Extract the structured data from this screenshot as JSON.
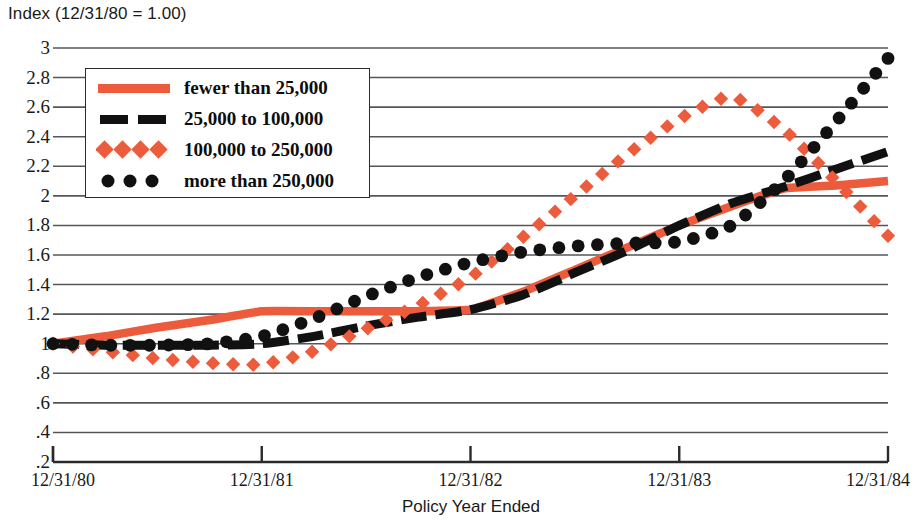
{
  "chart_data": {
    "type": "line",
    "title": "Index (12/31/80 = 1.00)",
    "xlabel": "Policy Year Ended",
    "ylabel": "Index (12/31/80 = 1.00)",
    "xlim": [
      1980.0,
      1984.0
    ],
    "ylim": [
      0.2,
      3.0
    ],
    "grid": true,
    "legend_position": "upper-left",
    "x_categories": [
      "12/31/80",
      "12/31/81",
      "12/31/82",
      "12/31/83",
      "12/31/84"
    ],
    "y_ticks": [
      "3",
      "2.8",
      "2.6",
      "2.4",
      "2.2",
      "2",
      "1.8",
      "1.6",
      "1.4",
      "1.2",
      "1",
      ".8",
      ".6",
      ".4",
      ".2"
    ],
    "y_tick_values": [
      3,
      2.8,
      2.6,
      2.4,
      2.2,
      2,
      1.8,
      1.6,
      1.4,
      1.2,
      1,
      0.8,
      0.6,
      0.4,
      0.2
    ],
    "series": [
      {
        "name": "fewer than 25,000",
        "style": "solid-line",
        "color": "#EC5B3B",
        "x": [
          1980.0,
          1980.25,
          1980.5,
          1980.75,
          1981.0,
          1981.25,
          1981.5,
          1981.75,
          1982.0,
          1982.25,
          1982.5,
          1982.75,
          1983.0,
          1983.25,
          1983.5,
          1983.75,
          1984.0
        ],
        "values": [
          1.0,
          1.05,
          1.11,
          1.16,
          1.22,
          1.22,
          1.22,
          1.22,
          1.23,
          1.35,
          1.5,
          1.65,
          1.8,
          1.93,
          2.05,
          2.07,
          2.1
        ]
      },
      {
        "name": "25,000 to 100,000",
        "style": "dashed-line",
        "color": "#111111",
        "x": [
          1980.0,
          1980.25,
          1980.5,
          1980.75,
          1981.0,
          1981.25,
          1981.5,
          1981.75,
          1982.0,
          1982.25,
          1982.5,
          1982.75,
          1983.0,
          1983.25,
          1983.5,
          1983.75,
          1984.0
        ],
        "values": [
          1.0,
          0.99,
          0.99,
          0.99,
          1.0,
          1.05,
          1.12,
          1.18,
          1.23,
          1.33,
          1.48,
          1.63,
          1.8,
          1.95,
          2.06,
          2.18,
          2.3
        ]
      },
      {
        "name": "100,000 to 250,000",
        "style": "diamond-markers",
        "color": "#EC5B3B",
        "x": [
          1980.0,
          1980.25,
          1980.5,
          1980.75,
          1981.0,
          1981.25,
          1981.5,
          1981.75,
          1982.0,
          1982.25,
          1982.5,
          1982.75,
          1983.0,
          1983.25,
          1983.5,
          1983.75,
          1984.0
        ],
        "values": [
          1.0,
          0.95,
          0.9,
          0.87,
          0.86,
          0.95,
          1.1,
          1.26,
          1.45,
          1.72,
          2.0,
          2.28,
          2.52,
          2.67,
          2.45,
          2.1,
          1.73
        ]
      },
      {
        "name": "more than 250,000",
        "style": "circle-markers",
        "color": "#111111",
        "x": [
          1980.0,
          1980.25,
          1980.5,
          1980.75,
          1981.0,
          1981.25,
          1981.5,
          1981.75,
          1982.0,
          1982.25,
          1982.5,
          1982.75,
          1983.0,
          1983.25,
          1983.5,
          1983.75,
          1984.0
        ],
        "values": [
          1.0,
          0.99,
          0.99,
          1.0,
          1.05,
          1.17,
          1.32,
          1.45,
          1.55,
          1.62,
          1.66,
          1.68,
          1.69,
          1.8,
          2.1,
          2.5,
          2.93
        ]
      }
    ]
  },
  "legend": {
    "items": [
      {
        "label": "fewer than 25,000"
      },
      {
        "label": "25,000 to 100,000"
      },
      {
        "label": "100,000 to 250,000"
      },
      {
        "label": "more than 250,000"
      }
    ]
  },
  "colors": {
    "accent_orange": "#EC5B3B",
    "series_black": "#111111",
    "gridline": "#55565a",
    "axis": "#2a2a2a",
    "background": "#ffffff"
  }
}
